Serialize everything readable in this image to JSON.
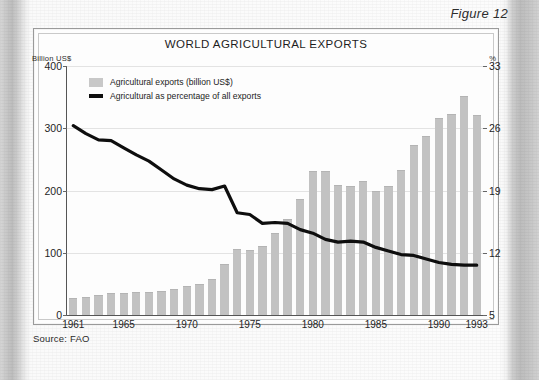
{
  "figure": {
    "label": "Figure 12"
  },
  "source": {
    "text": "Source: FAO"
  },
  "axis_labels": {
    "left_unit": "Billion US$",
    "right_unit": "%"
  },
  "legend": {
    "bars": "Agricultural exports (billion US$)",
    "line": "Agricultural as percentage of all exports"
  },
  "colors": {
    "bar": "#c2c2c2",
    "line": "#0e0e0e",
    "grid": "#e3e3e3",
    "frame": "#9a9a9a"
  },
  "chart_data": {
    "type": "bar",
    "title": "WORLD AGRICULTURAL EXPORTS",
    "xlabel": "",
    "ylabel": "Billion US$",
    "ylabel_right": "%",
    "ylim": [
      0,
      400
    ],
    "ylim_right": [
      5,
      33
    ],
    "yticks": [
      0,
      100,
      200,
      300,
      400
    ],
    "yticks_right": [
      5,
      12,
      19,
      26,
      33
    ],
    "grid": true,
    "legend_position": "top-left",
    "categories": [
      1961,
      1962,
      1963,
      1964,
      1965,
      1966,
      1967,
      1968,
      1969,
      1970,
      1971,
      1972,
      1973,
      1974,
      1975,
      1976,
      1977,
      1978,
      1979,
      1980,
      1981,
      1982,
      1983,
      1984,
      1985,
      1986,
      1987,
      1988,
      1989,
      1990,
      1991,
      1992,
      1993
    ],
    "xticks": [
      1961,
      1965,
      1970,
      1975,
      1980,
      1985,
      1990,
      1993
    ],
    "series": [
      {
        "name": "Agricultural exports (billion US$)",
        "type": "bar",
        "axis": "left",
        "unit": "billion US$",
        "values": [
          26,
          27,
          30,
          33,
          34,
          36,
          36,
          37,
          40,
          45,
          48,
          57,
          80,
          104,
          103,
          110,
          130,
          152,
          185,
          230,
          229,
          207,
          205,
          213,
          198,
          205,
          232,
          272,
          286,
          315,
          322,
          350,
          320
        ]
      },
      {
        "name": "Agricultural as percentage of all exports",
        "type": "line",
        "axis": "right",
        "unit": "%",
        "values": [
          26.3,
          25.4,
          24.7,
          24.6,
          23.8,
          23.0,
          22.3,
          21.3,
          20.3,
          19.6,
          19.2,
          19.1,
          19.5,
          16.5,
          16.3,
          15.3,
          15.4,
          15.3,
          14.6,
          14.2,
          13.5,
          13.2,
          13.3,
          13.2,
          12.6,
          12.2,
          11.8,
          11.7,
          11.3,
          10.9,
          10.7,
          10.6,
          10.6
        ]
      }
    ]
  }
}
